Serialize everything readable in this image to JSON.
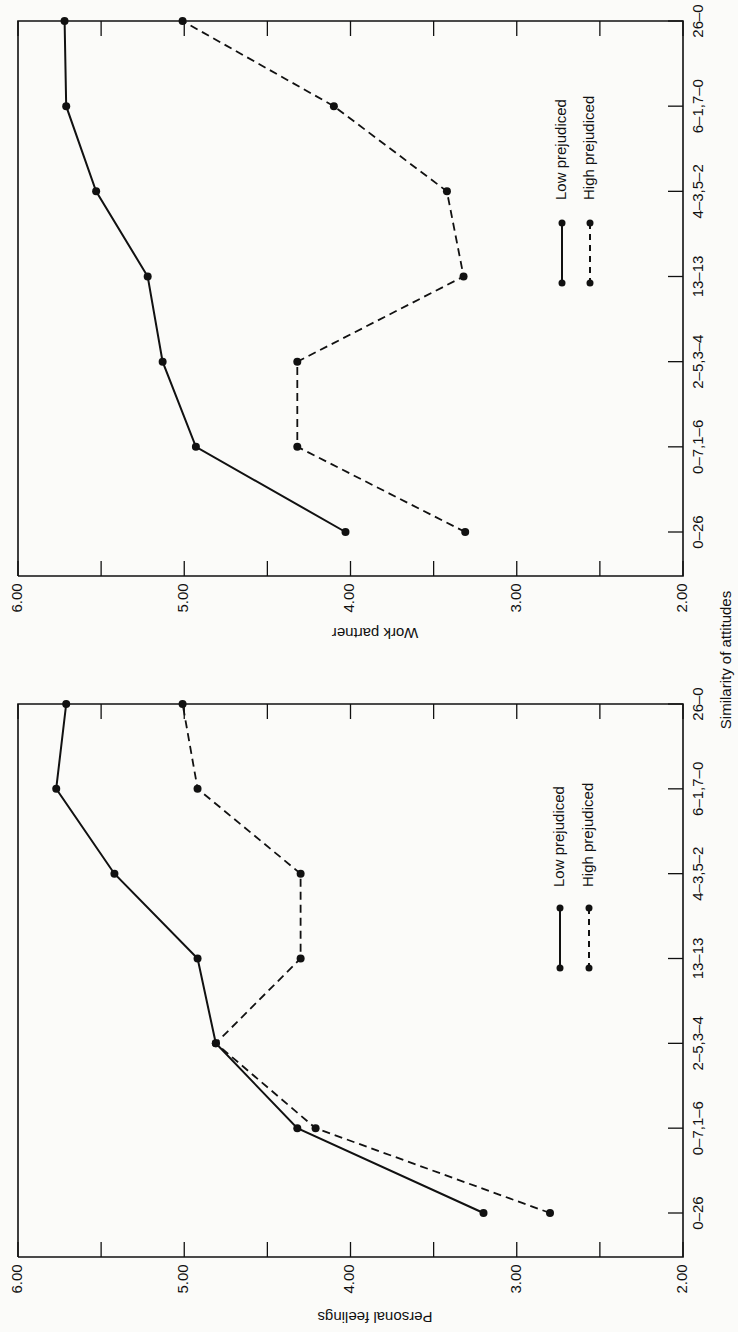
{
  "figure": {
    "rotation_note_visible": false,
    "shared_xlabel": "Similarity of attitudes"
  },
  "chart_data": [
    {
      "type": "line",
      "title": "",
      "xlabel": "Similarity of attitudes",
      "ylabel": "Work partner",
      "categories": [
        "0–26",
        "0–7,1–6",
        "2–5,3–4",
        "13–13",
        "4–3,5–2",
        "6–1,7–0",
        "26–0"
      ],
      "yticks": [
        "2.00",
        "3.00",
        "4.00",
        "5.00",
        "6.00"
      ],
      "ylim": [
        2.0,
        6.0
      ],
      "grid": false,
      "legend_position": "upper-left (rotated figure)",
      "series": [
        {
          "name": "Low prejudiced",
          "style": "solid",
          "values": [
            4.03,
            4.93,
            5.13,
            5.22,
            5.53,
            5.71,
            5.72
          ]
        },
        {
          "name": "High prejudiced",
          "style": "dashed",
          "values": [
            3.31,
            4.32,
            4.32,
            3.32,
            3.42,
            4.1,
            5.01
          ]
        }
      ]
    },
    {
      "type": "line",
      "title": "",
      "xlabel": "Similarity of attitudes",
      "ylabel": "Personal feelings",
      "categories": [
        "0–26",
        "0–7,1–6",
        "2–5,3–4",
        "13–13",
        "4–3,5–2",
        "6–1,7–0",
        "26–0"
      ],
      "yticks": [
        "2.00",
        "3.00",
        "4.00",
        "5.00",
        "6.00"
      ],
      "ylim": [
        2.0,
        6.0
      ],
      "grid": false,
      "legend_position": "upper-left (rotated figure)",
      "series": [
        {
          "name": "Low prejudiced",
          "style": "solid",
          "values": [
            3.2,
            4.32,
            4.81,
            4.92,
            5.42,
            5.77,
            5.71
          ]
        },
        {
          "name": "High prejudiced",
          "style": "dashed",
          "values": [
            2.8,
            4.21,
            4.81,
            4.3,
            4.3,
            4.92,
            5.01
          ]
        }
      ]
    }
  ],
  "layout": {
    "panels": [
      {
        "top": 21,
        "bottom": 576,
        "left": 18,
        "right": 683,
        "legend": {
          "low_x": 562,
          "high_x": 590,
          "text_top": 73,
          "text_bottom": 200,
          "line_top": 223,
          "line_bottom": 283
        },
        "ylabel_pos": {
          "x": 375,
          "y": 632
        }
      },
      {
        "top": 704,
        "bottom": 1257,
        "left": 18,
        "right": 683,
        "legend": {
          "low_x": 560,
          "high_x": 589,
          "text_top": 753,
          "text_bottom": 887,
          "line_top": 908,
          "line_bottom": 968
        },
        "ylabel_pos": {
          "x": 375,
          "y": 1316
        }
      }
    ],
    "xlabel_pos": {
      "x": 727,
      "y": 660
    }
  }
}
